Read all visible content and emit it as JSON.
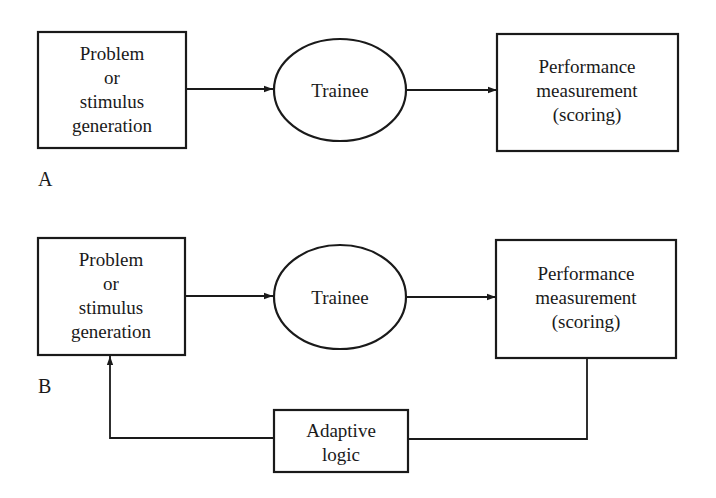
{
  "diagram": {
    "panel_a": {
      "label": "A",
      "nodes": {
        "problem": {
          "line1": "Problem",
          "line2": "or",
          "line3": "stimulus",
          "line4": "generation"
        },
        "trainee": {
          "line1": "Trainee"
        },
        "performance": {
          "line1": "Performance",
          "line2": "measurement",
          "line3": "(scoring)"
        }
      },
      "edges": [
        {
          "from": "problem",
          "to": "trainee"
        },
        {
          "from": "trainee",
          "to": "performance"
        }
      ]
    },
    "panel_b": {
      "label": "B",
      "nodes": {
        "problem": {
          "line1": "Problem",
          "line2": "or",
          "line3": "stimulus",
          "line4": "generation"
        },
        "trainee": {
          "line1": "Trainee"
        },
        "performance": {
          "line1": "Performance",
          "line2": "measurement",
          "line3": "(scoring)"
        },
        "adaptive": {
          "line1": "Adaptive",
          "line2": "logic"
        }
      },
      "edges": [
        {
          "from": "problem",
          "to": "trainee"
        },
        {
          "from": "trainee",
          "to": "performance"
        },
        {
          "from": "performance",
          "to": "adaptive"
        },
        {
          "from": "adaptive",
          "to": "problem"
        }
      ]
    },
    "colors": {
      "ink": "#1a1a1a",
      "background": "#ffffff"
    }
  }
}
